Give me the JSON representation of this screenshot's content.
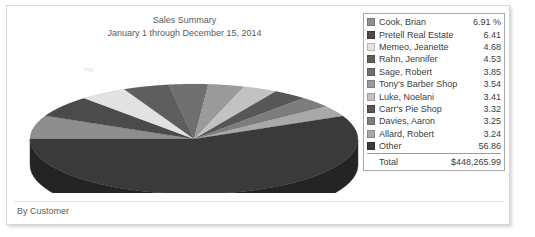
{
  "report": {
    "title": "Sales Summary",
    "subtitle": "January 1 through December 15, 2014",
    "footer_caption": "By Customer",
    "ghost_label": "7%"
  },
  "legend": {
    "total_label": "Total",
    "total_value": "$448,265.99",
    "items": [
      {
        "label": "Cook, Brian",
        "value": "6.91 %",
        "color": "#8e8e8e"
      },
      {
        "label": "Pretell Real Estate",
        "value": "6.41",
        "color": "#4b4b4b"
      },
      {
        "label": "Memeo, Jeanette",
        "value": "4.68",
        "color": "#e2e2e2"
      },
      {
        "label": "Rahn, Jennifer",
        "value": "4.53",
        "color": "#5e5e5e"
      },
      {
        "label": "Sage, Robert",
        "value": "3.85",
        "color": "#6f6f6f"
      },
      {
        "label": "Tony's Barber Shop",
        "value": "3.54",
        "color": "#9a9a9a"
      },
      {
        "label": "Luke, Noelani",
        "value": "3.41",
        "color": "#c2c2c2"
      },
      {
        "label": "Carr's Pie Shop",
        "value": "3.32",
        "color": "#575757"
      },
      {
        "label": "Davies, Aaron",
        "value": "3.25",
        "color": "#7d7d7d"
      },
      {
        "label": "Allard, Robert",
        "value": "3.24",
        "color": "#a9a9a9"
      },
      {
        "label": "Other",
        "value": "56.86",
        "color": "#3a3a3a"
      }
    ]
  },
  "chart_data": {
    "type": "pie",
    "title": "Sales Summary",
    "subtitle": "January 1 through December 15, 2014",
    "xlabel": "By Customer",
    "ylabel": "",
    "value_unit": "percent",
    "total": "$448,265.99",
    "three_d": true,
    "legend_position": "right",
    "grid": false,
    "labels": [
      "Cook, Brian",
      "Pretell Real Estate",
      "Memeo, Jeanette",
      "Rahn, Jennifer",
      "Sage, Robert",
      "Tony's Barber Shop",
      "Luke, Noelani",
      "Carr's Pie Shop",
      "Davies, Aaron",
      "Allard, Robert",
      "Other"
    ],
    "values": [
      6.91,
      6.41,
      4.68,
      4.53,
      3.85,
      3.54,
      3.41,
      3.32,
      3.25,
      3.24,
      56.86
    ],
    "colors": [
      "#8e8e8e",
      "#4b4b4b",
      "#e2e2e2",
      "#5e5e5e",
      "#6f6f6f",
      "#9a9a9a",
      "#c2c2c2",
      "#575757",
      "#7d7d7d",
      "#a9a9a9",
      "#3a3a3a"
    ]
  }
}
